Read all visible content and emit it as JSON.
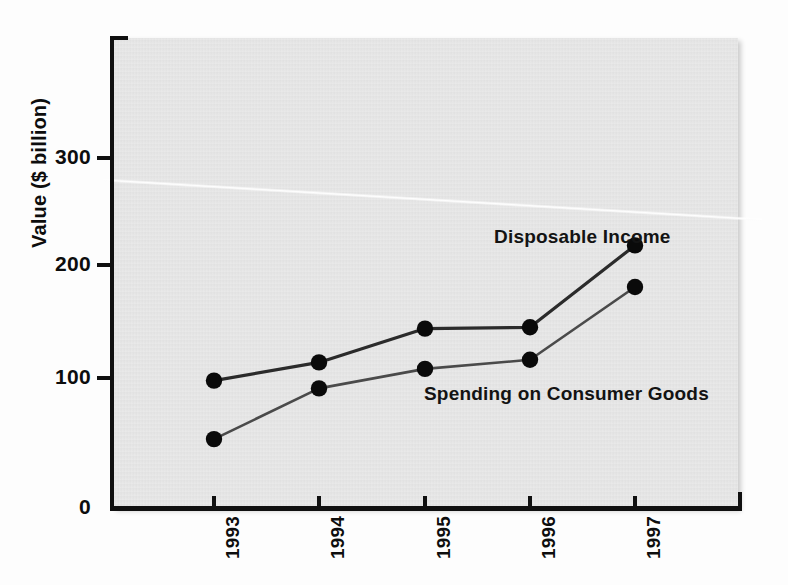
{
  "chart_data": {
    "type": "line",
    "title": "",
    "subtitle": "",
    "xlabel": "",
    "ylabel": "Value ($ billion)",
    "categories": [
      "1993",
      "1994",
      "1995",
      "1996",
      "1997"
    ],
    "x_tick_labels": [
      "1993",
      "1994",
      "1995",
      "1996",
      "1997"
    ],
    "y_tick_labels": [
      "0",
      "100",
      "200",
      "300"
    ],
    "y_ticks": [
      0,
      100,
      200,
      300
    ],
    "ylim": [
      0,
      400
    ],
    "grid": false,
    "legend_position": "inline-annotation",
    "series": [
      {
        "name": "Disposable Income",
        "values": [
          98,
          112,
          138,
          139,
          202
        ],
        "color": "#2b2b2b",
        "marker": "circle"
      },
      {
        "name": "Spending on Consumer Goods",
        "values": [
          53,
          92,
          107,
          114,
          170
        ],
        "color": "#4a4a4a",
        "marker": "circle"
      }
    ],
    "annotations": [
      {
        "text": "Disposable Income",
        "series": "Disposable Income"
      },
      {
        "text": "Spending on Consumer Goods",
        "series": "Spending on Consumer Goods"
      }
    ]
  },
  "axes": {
    "y_title": "Value ($ billion)",
    "y_tick_300": "300",
    "y_tick_200": "200",
    "y_tick_100": "100",
    "y_tick_0": "0",
    "x_tick_1993": "1993",
    "x_tick_1994": "1994",
    "x_tick_1995": "1995",
    "x_tick_1996": "1996",
    "x_tick_1997": "1997"
  },
  "labels": {
    "disposable_income": "Disposable Income",
    "spending_consumer_goods": "Spending on Consumer Goods"
  },
  "colors": {
    "plot_background": "#e5e5e5",
    "page_background": "#fdfdfd",
    "axis": "#101010",
    "series_disposable_income": "#2b2b2b",
    "series_spending": "#4a4a4a",
    "marker": "#0a0a0a",
    "text": "#0d0d0d"
  }
}
